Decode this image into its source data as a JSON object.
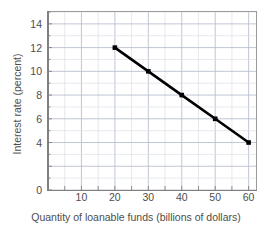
{
  "chart_data": {
    "type": "line",
    "title": "",
    "xlabel": "Quantity of loanable funds (billions of dollars)",
    "ylabel": "Interest rate (percent)",
    "xlim": [
      0,
      62.5
    ],
    "ylim": [
      0,
      15
    ],
    "grid": true,
    "legend": "none",
    "x_ticks": [
      10,
      20,
      30,
      40,
      50,
      60
    ],
    "x_tick_labels": [
      "10",
      "20",
      "30",
      "40",
      "50",
      "60"
    ],
    "y_ticks": [
      0,
      4,
      6,
      8,
      10,
      12,
      14
    ],
    "y_tick_labels": [
      "0",
      "4",
      "6",
      "8",
      "10",
      "12",
      "14"
    ],
    "x_minor_step": 5,
    "y_minor_step": 1,
    "y_major_step": 2,
    "series": [
      {
        "name": "Demand for loanable funds",
        "marker": "square",
        "color": "#000000",
        "x": [
          20,
          30,
          40,
          50,
          60
        ],
        "y": [
          12,
          10,
          8,
          6,
          4
        ],
        "points": [
          {
            "x": 20,
            "y": 12
          },
          {
            "x": 30,
            "y": 10
          },
          {
            "x": 40,
            "y": 8
          },
          {
            "x": 50,
            "y": 6
          },
          {
            "x": 60,
            "y": 4
          }
        ]
      }
    ]
  },
  "colors": {
    "line": "#000000",
    "marker": "#000000",
    "grid_major": "#b9bfcf",
    "grid_minor": "#dde0e8",
    "axis": "#808080",
    "text": "#4d4d4d",
    "background": "#ffffff"
  },
  "axes": {
    "x_title": "Quantity of loanable funds (billions of dollars)",
    "y_title": "Interest rate (percent)"
  }
}
